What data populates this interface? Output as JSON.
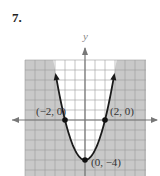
{
  "problem_number": "7.",
  "chart_data": {
    "type": "line",
    "title": "",
    "function": "y = x^2 - 4",
    "xlabel": "",
    "ylabel": "y",
    "xlim": [
      -6,
      6
    ],
    "ylim": [
      -5.6,
      6
    ],
    "grid": true,
    "shading": "outside parabola (y < x^2 - 4)",
    "series": [
      {
        "name": "parabola",
        "x": [
          -2.9,
          -2.5,
          -2,
          -1.5,
          -1,
          -0.5,
          0,
          0.5,
          1,
          1.5,
          2,
          2.5,
          2.9
        ],
        "y": [
          4.41,
          2.25,
          0,
          -1.75,
          -3,
          -3.75,
          -4,
          -3.75,
          -3,
          -1.75,
          0,
          2.25,
          4.41
        ]
      }
    ],
    "points": [
      {
        "x": -2,
        "y": 0,
        "label": "(−2, 0)"
      },
      {
        "x": 2,
        "y": 0,
        "label": "(2, 0)"
      },
      {
        "x": 0,
        "y": -4,
        "label": "(0, −4)"
      }
    ]
  }
}
